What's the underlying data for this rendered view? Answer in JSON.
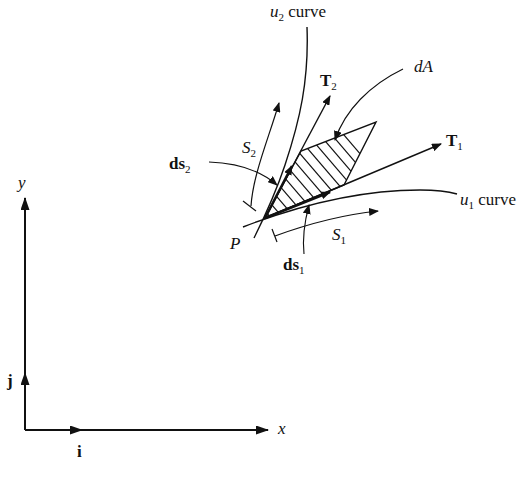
{
  "labels": {
    "u2_curve": {
      "var": "u",
      "sub": "2",
      "text": " curve"
    },
    "u1_curve": {
      "var": "u",
      "sub": "1",
      "text": " curve"
    },
    "T2": {
      "main": "T",
      "sub": "2"
    },
    "T1": {
      "main": "T",
      "sub": "1"
    },
    "dA": "dA",
    "S2": {
      "main": "S",
      "sub": "2"
    },
    "S1": {
      "main": "S",
      "sub": "1"
    },
    "ds2": {
      "main": "ds",
      "sub": "2"
    },
    "ds1": {
      "main": "ds",
      "sub": "1"
    },
    "P": "P",
    "x_axis": "x",
    "y_axis": "y",
    "i_vector": "i",
    "j_vector": "j"
  },
  "colors": {
    "ink": "#111111",
    "background": "#ffffff"
  }
}
